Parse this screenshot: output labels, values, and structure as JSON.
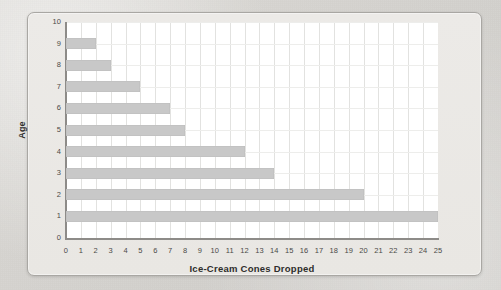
{
  "chart_data": {
    "type": "bar",
    "orientation": "horizontal",
    "title": "",
    "xlabel": "Ice-Cream Cones Dropped",
    "ylabel": "Age",
    "categories": [
      "0",
      "1",
      "2",
      "3",
      "4",
      "5",
      "6",
      "7",
      "8",
      "9",
      "10"
    ],
    "values": [
      0,
      25,
      20,
      14,
      12,
      8,
      7,
      5,
      3,
      2,
      0
    ],
    "series": [
      {
        "name": "Ice-Cream Cones Dropped",
        "points": [
          {
            "age": 9,
            "cones": 2
          },
          {
            "age": 8,
            "cones": 3
          },
          {
            "age": 7,
            "cones": 5
          },
          {
            "age": 6,
            "cones": 7
          },
          {
            "age": 5,
            "cones": 8
          },
          {
            "age": 4,
            "cones": 12
          },
          {
            "age": 3,
            "cones": 14
          },
          {
            "age": 2,
            "cones": 20
          },
          {
            "age": 1,
            "cones": 25
          }
        ]
      }
    ],
    "xlim": [
      0,
      25
    ],
    "ylim": [
      0,
      10
    ],
    "x_ticks": [
      "0",
      "1",
      "2",
      "3",
      "4",
      "5",
      "6",
      "7",
      "8",
      "9",
      "10",
      "11",
      "12",
      "13",
      "14",
      "15",
      "16",
      "17",
      "18",
      "19",
      "20",
      "21",
      "22",
      "23",
      "24",
      "25"
    ],
    "y_ticks": [
      "0",
      "1",
      "2",
      "3",
      "4",
      "5",
      "6",
      "7",
      "8",
      "9",
      "10"
    ],
    "grid": true,
    "legend": "none",
    "bar_color": "#c8c8c8",
    "plot_background": "#ffffff",
    "card_background": "#eae8e5",
    "page_background": "#d6d4d0",
    "axis_color": "#8d8b88",
    "gridline_color": "#e2e2e0",
    "text_color": "#2e2d2c"
  }
}
